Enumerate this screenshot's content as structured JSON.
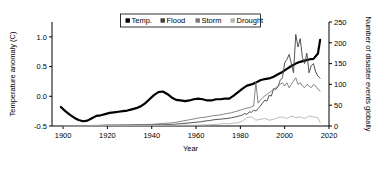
{
  "chart_data": {
    "type": "line",
    "title": "",
    "xlabel": "Year",
    "ylabel": "Temperature anomaly (C)",
    "y2label": "Number of disaster events globally",
    "xlim": [
      1895,
      2020
    ],
    "ylim": [
      -0.5,
      1.25
    ],
    "y2lim": [
      0,
      250
    ],
    "grid": false,
    "legend_position": "top-center",
    "xticks": [
      "1900",
      "1920",
      "1940",
      "1960",
      "1980",
      "2000",
      "2020"
    ],
    "xtick_values": [
      1900,
      1920,
      1940,
      1960,
      1980,
      2000,
      2020
    ],
    "yticks": [
      "1.0",
      "0.5",
      "0.0",
      "-0.5"
    ],
    "ytick_values": [
      1.0,
      0.5,
      0.0,
      -0.5
    ],
    "y2ticks": [
      "250",
      "200",
      "150",
      "100",
      "50",
      "0"
    ],
    "y2tick_values": [
      250,
      200,
      150,
      100,
      50,
      0
    ],
    "legend": [
      {
        "label": "Temp.",
        "color": "#000000",
        "marker": "square"
      },
      {
        "label": "Flood",
        "color": "#3f3f3f",
        "marker": "square"
      },
      {
        "label": "Storm",
        "color": "#777777",
        "marker": "square"
      },
      {
        "label": "Drought",
        "color": "#b4b4b4",
        "marker": "square"
      }
    ],
    "series": [
      {
        "name": "Temp.",
        "axis": "left",
        "color": "#000000",
        "width": 2.2,
        "x": [
          1899,
          1901,
          1903,
          1905,
          1907,
          1909,
          1911,
          1913,
          1915,
          1917,
          1919,
          1921,
          1923,
          1925,
          1927,
          1929,
          1931,
          1933,
          1935,
          1937,
          1939,
          1941,
          1943,
          1945,
          1947,
          1949,
          1951,
          1953,
          1955,
          1957,
          1959,
          1961,
          1963,
          1965,
          1967,
          1969,
          1971,
          1973,
          1975,
          1977,
          1979,
          1981,
          1983,
          1985,
          1987,
          1989,
          1991,
          1993,
          1995,
          1997,
          1999,
          2001,
          2003,
          2005,
          2007,
          2009,
          2011,
          2013,
          2015,
          2016
        ],
        "y": [
          -0.18,
          -0.25,
          -0.31,
          -0.36,
          -0.4,
          -0.42,
          -0.41,
          -0.37,
          -0.33,
          -0.32,
          -0.3,
          -0.28,
          -0.27,
          -0.26,
          -0.25,
          -0.24,
          -0.22,
          -0.2,
          -0.17,
          -0.12,
          -0.05,
          0.02,
          0.07,
          0.08,
          0.04,
          -0.02,
          -0.06,
          -0.07,
          -0.08,
          -0.07,
          -0.05,
          -0.04,
          -0.05,
          -0.07,
          -0.07,
          -0.05,
          -0.05,
          -0.04,
          -0.04,
          0.01,
          0.07,
          0.13,
          0.18,
          0.2,
          0.23,
          0.27,
          0.29,
          0.3,
          0.33,
          0.37,
          0.41,
          0.46,
          0.51,
          0.55,
          0.58,
          0.6,
          0.62,
          0.63,
          0.72,
          0.95
        ]
      },
      {
        "name": "Flood",
        "axis": "right",
        "color": "#3f3f3f",
        "width": 0.9,
        "x": [
          1900,
          1905,
          1910,
          1915,
          1920,
          1925,
          1930,
          1935,
          1940,
          1945,
          1950,
          1952,
          1954,
          1956,
          1958,
          1960,
          1962,
          1964,
          1966,
          1968,
          1970,
          1972,
          1974,
          1976,
          1978,
          1980,
          1981,
          1982,
          1983,
          1984,
          1985,
          1986,
          1987,
          1988,
          1989,
          1990,
          1991,
          1992,
          1993,
          1994,
          1995,
          1996,
          1997,
          1998,
          1999,
          2000,
          2001,
          2002,
          2003,
          2004,
          2005,
          2006,
          2007,
          2008,
          2009,
          2010,
          2011,
          2012,
          2013,
          2014,
          2015,
          2016
        ],
        "y": [
          1,
          1,
          1,
          1,
          2,
          2,
          2,
          3,
          3,
          3,
          4,
          5,
          6,
          7,
          8,
          9,
          10,
          12,
          13,
          15,
          16,
          17,
          18,
          20,
          22,
          25,
          27,
          30,
          28,
          34,
          33,
          38,
          36,
          42,
          48,
          55,
          62,
          60,
          74,
          72,
          90,
          88,
          95,
          110,
          116,
          152,
          160,
          172,
          150,
          128,
          220,
          190,
          210,
          165,
          150,
          175,
          128,
          145,
          150,
          130,
          120,
          115
        ]
      },
      {
        "name": "Storm",
        "axis": "right",
        "color": "#777777",
        "width": 0.9,
        "x": [
          1900,
          1910,
          1920,
          1930,
          1940,
          1945,
          1950,
          1952,
          1954,
          1956,
          1958,
          1960,
          1962,
          1964,
          1966,
          1968,
          1970,
          1972,
          1974,
          1976,
          1978,
          1980,
          1982,
          1984,
          1986,
          1987,
          1988,
          1989,
          1990,
          1991,
          1992,
          1993,
          1994,
          1995,
          1996,
          1997,
          1998,
          1999,
          2000,
          2001,
          2002,
          2003,
          2004,
          2005,
          2006,
          2007,
          2008,
          2009,
          2010,
          2011,
          2012,
          2013,
          2014,
          2015,
          2016
        ],
        "y": [
          1,
          1,
          2,
          3,
          4,
          6,
          8,
          10,
          12,
          14,
          16,
          18,
          20,
          21,
          23,
          25,
          26,
          28,
          30,
          32,
          35,
          38,
          42,
          44,
          48,
          105,
          55,
          62,
          68,
          72,
          76,
          80,
          84,
          88,
          92,
          96,
          100,
          104,
          96,
          104,
          92,
          100,
          108,
          116,
          100,
          104,
          96,
          92,
          100,
          96,
          92,
          100,
          96,
          88,
          84
        ]
      },
      {
        "name": "Drought",
        "axis": "right",
        "color": "#b4b4b4",
        "width": 0.9,
        "x": [
          1900,
          1910,
          1920,
          1930,
          1940,
          1950,
          1960,
          1965,
          1970,
          1973,
          1975,
          1977,
          1979,
          1981,
          1983,
          1985,
          1987,
          1989,
          1991,
          1993,
          1995,
          1997,
          1999,
          2001,
          2003,
          2005,
          2007,
          2009,
          2011,
          2013,
          2015,
          2016
        ],
        "y": [
          0,
          0,
          1,
          1,
          1,
          2,
          2,
          3,
          4,
          6,
          5,
          7,
          8,
          12,
          20,
          22,
          14,
          16,
          18,
          14,
          16,
          20,
          22,
          18,
          24,
          20,
          22,
          18,
          24,
          22,
          20,
          8
        ]
      }
    ]
  }
}
